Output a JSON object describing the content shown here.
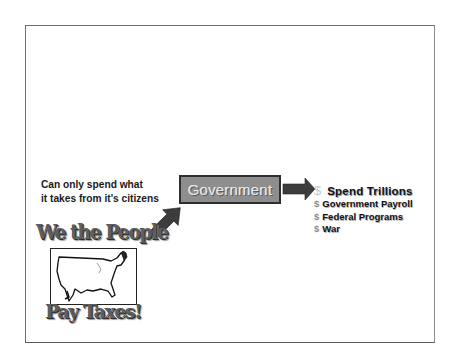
{
  "slide": {
    "caption": {
      "line1": "Can only spend what",
      "line2": "it takes from it's citizens"
    },
    "government_box": {
      "label": "Government",
      "fill_color": "#8e8e8e",
      "border_color": "#2e2e2e"
    },
    "spending": {
      "heading_symbol": "$",
      "heading": "Spend Trillions",
      "items": [
        {
          "symbol": "$",
          "label": "Government Payroll"
        },
        {
          "symbol": "$",
          "label": "Federal Programs"
        },
        {
          "symbol": "$",
          "label": "War"
        }
      ]
    },
    "clipart": {
      "top_text": "We the People",
      "bottom_text": "Pay Taxes!",
      "image": "us-map-outline"
    },
    "arrows": [
      {
        "from": "we-the-people",
        "to": "government",
        "direction": "up-right"
      },
      {
        "from": "government",
        "to": "spend-trillions",
        "direction": "right"
      }
    ],
    "colors": {
      "arrow": "#3c3c3c",
      "frame": "#6e6e6e",
      "text": "#1a1a1a"
    }
  }
}
